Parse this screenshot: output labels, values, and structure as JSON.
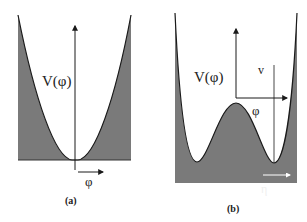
{
  "panels": [
    {
      "id": "a",
      "caption": "(a)",
      "y_label": "V(φ)",
      "x_label": "φ",
      "shape": "single-well parabola"
    },
    {
      "id": "b",
      "caption": "(b)",
      "y_label": "V(φ)",
      "x_label": "φ",
      "vev_label": "v",
      "fluctuation_label": "η",
      "shape": "double-well (Mexican hat) potential"
    }
  ],
  "colors": {
    "fill": "#7a7a7a",
    "curve": "#1a1a1a",
    "axis": "#1a1a1a",
    "background": "#ffffff"
  }
}
